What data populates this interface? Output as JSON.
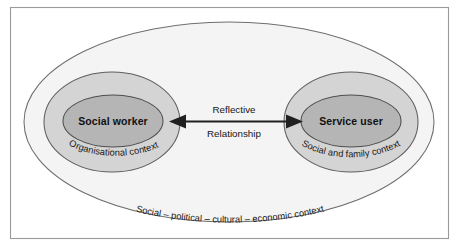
{
  "diagram": {
    "type": "nested-ellipse-venn",
    "frame": {
      "border_color": "#9a9a9a",
      "background_color": "#ffffff"
    },
    "colors": {
      "outer_fill": "#f4f4f4",
      "mid_fill": "#d4d4d4",
      "inner_fill": "#b5b5b5",
      "outline": "#5e5e5e",
      "text": "#111111",
      "arrow": "#202020"
    },
    "outer_context": {
      "label": "Social – political – cultural – economic context"
    },
    "left_group": {
      "core_label": "Social worker",
      "context_label": "Organisational context"
    },
    "right_group": {
      "core_label": "Service user",
      "context_label": "Social and family context"
    },
    "connector": {
      "label_top": "Reflective",
      "label_bottom": "Relationship",
      "direction": "bidirectional"
    }
  }
}
